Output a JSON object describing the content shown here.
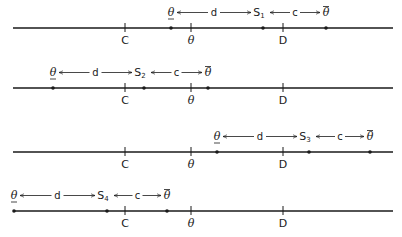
{
  "diagram": {
    "rows": [
      {
        "id": "row-1",
        "line_y": 28,
        "ticks": [
          {
            "label": "C",
            "x": 125
          },
          {
            "label": "θ",
            "x": 191
          },
          {
            "label": "D",
            "x": 283
          }
        ],
        "points": {
          "theta_under": 171,
          "s": 263,
          "theta_over": 326
        },
        "s_label": "S",
        "s_sub": "1",
        "d_label": "d",
        "c_label": "c",
        "theta_under_label": "θ",
        "theta_over_label": "θ"
      },
      {
        "id": "row-2",
        "line_y": 88,
        "ticks": [
          {
            "label": "C",
            "x": 125
          },
          {
            "label": "θ",
            "x": 191
          },
          {
            "label": "D",
            "x": 283
          }
        ],
        "points": {
          "theta_under": 53,
          "s": 144,
          "theta_over": 208
        },
        "s_label": "S",
        "s_sub": "2",
        "d_label": "d",
        "c_label": "c",
        "theta_under_label": "θ",
        "theta_over_label": "θ"
      },
      {
        "id": "row-3",
        "line_y": 152,
        "ticks": [
          {
            "label": "C",
            "x": 125
          },
          {
            "label": "θ",
            "x": 191
          },
          {
            "label": "D",
            "x": 283
          }
        ],
        "points": {
          "theta_under": 217,
          "s": 309,
          "theta_over": 370
        },
        "s_label": "S",
        "s_sub": "3",
        "d_label": "d",
        "c_label": "c",
        "theta_under_label": "θ",
        "theta_over_label": "θ"
      },
      {
        "id": "row-4",
        "line_y": 211,
        "ticks": [
          {
            "label": "C",
            "x": 125
          },
          {
            "label": "θ",
            "x": 191
          },
          {
            "label": "D",
            "x": 283
          }
        ],
        "points": {
          "theta_under": 14,
          "s": 107,
          "theta_over": 167
        },
        "s_label": "S",
        "s_sub": "4",
        "d_label": "d",
        "c_label": "c",
        "theta_under_label": "θ",
        "theta_over_label": "θ"
      }
    ],
    "line_x_start": 13,
    "line_x_end": 393,
    "colors": {
      "ink": "#1a1a1a",
      "background": "#ffffff"
    }
  }
}
